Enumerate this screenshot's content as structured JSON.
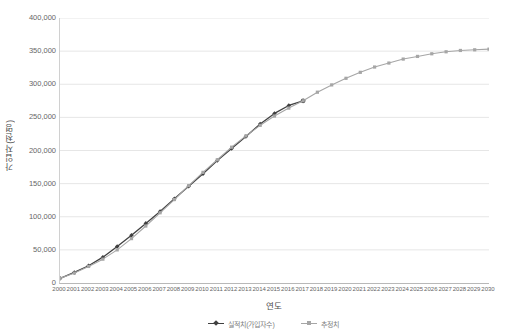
{
  "chart_data": {
    "type": "line",
    "title": "",
    "xlabel": "연도",
    "ylabel": "가입자(천명)",
    "ylim": [
      0,
      400000
    ],
    "ytick_labels": [
      "0",
      "50,000",
      "100,000",
      "150,000",
      "200,000",
      "250,000",
      "300,000",
      "350,000",
      "400,000"
    ],
    "ytick_values": [
      0,
      50000,
      100000,
      150000,
      200000,
      250000,
      300000,
      350000,
      400000
    ],
    "grid": "horizontal",
    "legend_position": "bottom",
    "x": [
      2000,
      2001,
      2002,
      2003,
      2004,
      2005,
      2006,
      2007,
      2008,
      2009,
      2010,
      2011,
      2012,
      2013,
      2014,
      2015,
      2016,
      2017,
      2018,
      2019,
      2020,
      2021,
      2022,
      2023,
      2024,
      2025,
      2026,
      2027,
      2028,
      2029,
      2030
    ],
    "categories": [
      "2000",
      "2001",
      "2002",
      "2003",
      "2004",
      "2005",
      "2006",
      "2007",
      "2008",
      "2009",
      "2010",
      "2011",
      "2012",
      "2013",
      "2014",
      "2015",
      "2016",
      "2017",
      "2018",
      "2019",
      "2020",
      "2021",
      "2022",
      "2023",
      "2024",
      "2025",
      "2026",
      "2027",
      "2028",
      "2029",
      "2030"
    ],
    "series": [
      {
        "name": "실적치(가입자수)",
        "color": "#404040",
        "marker": "diamond",
        "values": [
          7000,
          16000,
          26000,
          39000,
          55000,
          72000,
          90000,
          108000,
          127000,
          146000,
          165000,
          185000,
          203000,
          221000,
          240000,
          256000,
          268000,
          275000,
          null,
          null,
          null,
          null,
          null,
          null,
          null,
          null,
          null,
          null,
          null,
          null,
          null
        ]
      },
      {
        "name": "추정치",
        "color": "#a6a6a6",
        "marker": "square",
        "values": [
          7000,
          15000,
          25000,
          36000,
          50000,
          67000,
          86000,
          106000,
          126000,
          147000,
          167000,
          186000,
          205000,
          222000,
          238000,
          252000,
          264000,
          275000,
          288000,
          299000,
          309000,
          318000,
          326000,
          332000,
          338000,
          342000,
          346000,
          349000,
          351000,
          352000,
          353000
        ]
      }
    ]
  }
}
